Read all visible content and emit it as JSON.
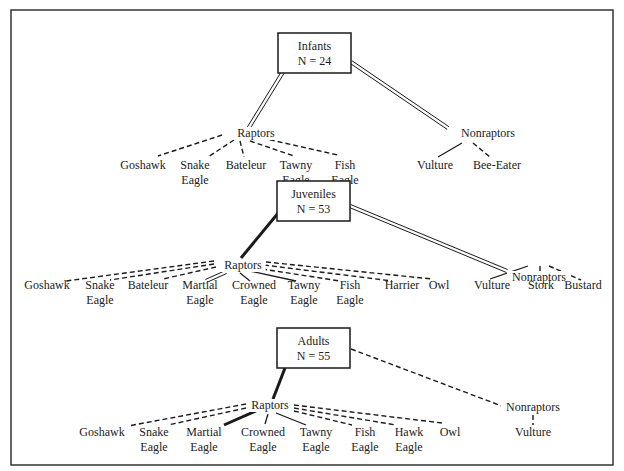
{
  "frame": {
    "x": 11,
    "y": 10,
    "w": 602,
    "h": 455,
    "stroke": "#333333"
  },
  "colors": {
    "line": "#1a1a1a",
    "text": "#222222"
  },
  "panels": [
    {
      "id": "infants",
      "box": {
        "label": "Infants",
        "n_label": "N = 24",
        "x": 278,
        "y": 33,
        "w": 73,
        "h": 40
      },
      "root_links": [
        {
          "target": "raptors",
          "style": "double",
          "from": [
            283,
            72
          ],
          "to": [
            248,
            129
          ]
        },
        {
          "target": "nonraptors",
          "style": "double",
          "from": [
            351,
            62
          ],
          "to": [
            448,
            128
          ]
        }
      ],
      "groups": [
        {
          "id": "raptors",
          "label": "Raptors",
          "x": 256,
          "y": 137
        },
        {
          "id": "nonraptors",
          "label": "Nonraptors",
          "x": 488,
          "y": 137
        }
      ],
      "leaves": [
        {
          "group": "raptors",
          "lines": [
            "Goshawk"
          ],
          "x": 143,
          "y": 169,
          "style": "dashed",
          "from": [
            222,
            135
          ],
          "to": [
            158,
            156
          ]
        },
        {
          "group": "raptors",
          "lines": [
            "Snake",
            "Eagle"
          ],
          "x": 195,
          "y": 169,
          "style": "dashed",
          "from": [
            234,
            140
          ],
          "to": [
            208,
            157
          ]
        },
        {
          "group": "raptors",
          "lines": [
            "Bateleur"
          ],
          "x": 246,
          "y": 169,
          "style": "dashed",
          "from": [
            240,
            141
          ],
          "to": [
            244,
            157
          ]
        },
        {
          "group": "raptors",
          "lines": [
            "Tawny",
            "Eagle"
          ],
          "x": 296,
          "y": 169,
          "style": "dashed",
          "from": [
            250,
            141
          ],
          "to": [
            294,
            156
          ]
        },
        {
          "group": "raptors",
          "lines": [
            "Fish",
            "Eagle"
          ],
          "x": 345,
          "y": 169,
          "style": "dashed",
          "from": [
            262,
            138
          ],
          "to": [
            338,
            155
          ]
        },
        {
          "group": "nonraptors",
          "lines": [
            "Vulture"
          ],
          "x": 435,
          "y": 169,
          "style": "solid",
          "from": [
            462,
            143
          ],
          "to": [
            438,
            157
          ]
        },
        {
          "group": "nonraptors",
          "lines": [
            "Bee-Eater"
          ],
          "x": 497,
          "y": 169,
          "style": "dashed",
          "from": [
            473,
            143
          ],
          "to": [
            490,
            157
          ]
        }
      ]
    },
    {
      "id": "juveniles",
      "box": {
        "label": "Juveniles",
        "n_label": "N = 53",
        "x": 277,
        "y": 181,
        "w": 73,
        "h": 40
      },
      "root_links": [
        {
          "target": "raptors",
          "style": "thick",
          "from": [
            279,
            212
          ],
          "to": [
            241,
            258
          ]
        },
        {
          "target": "nonraptors",
          "style": "double",
          "from": [
            350,
            206
          ],
          "to": [
            507,
            271
          ]
        }
      ],
      "groups": [
        {
          "id": "raptors",
          "label": "Raptors",
          "x": 243,
          "y": 269
        },
        {
          "id": "nonraptors",
          "label": "Nonraptors",
          "x": 539,
          "y": 281
        }
      ],
      "leaves": [
        {
          "group": "raptors",
          "lines": [
            "Goshawk"
          ],
          "x": 47,
          "y": 289,
          "style": "dashed",
          "from": [
            214,
            261
          ],
          "to": [
            66,
            281
          ]
        },
        {
          "group": "raptors",
          "lines": [
            "Snake",
            "Eagle"
          ],
          "x": 100,
          "y": 289,
          "style": "dashed",
          "from": [
            214,
            264
          ],
          "to": [
            110,
            280
          ]
        },
        {
          "group": "raptors",
          "lines": [
            "Bateleur"
          ],
          "x": 148,
          "y": 289,
          "style": "dashed",
          "from": [
            216,
            267
          ],
          "to": [
            163,
            279
          ]
        },
        {
          "group": "raptors",
          "lines": [
            "Martial",
            "Eagle"
          ],
          "x": 200,
          "y": 289,
          "style": "double",
          "from": [
            226,
            272
          ],
          "to": [
            206,
            281
          ]
        },
        {
          "group": "raptors",
          "lines": [
            "Crowned",
            "Eagle"
          ],
          "x": 254,
          "y": 289,
          "style": "solid",
          "from": [
            240,
            273
          ],
          "to": [
            250,
            281
          ]
        },
        {
          "group": "raptors",
          "lines": [
            "Tawny",
            "Eagle"
          ],
          "x": 304,
          "y": 289,
          "style": "solid",
          "from": [
            250,
            271
          ],
          "to": [
            296,
            281
          ]
        },
        {
          "group": "raptors",
          "lines": [
            "Fish",
            "Eagle"
          ],
          "x": 350,
          "y": 289,
          "style": "dashed",
          "from": [
            262,
            269
          ],
          "to": [
            340,
            281
          ]
        },
        {
          "group": "raptors",
          "lines": [
            "Harrier"
          ],
          "x": 402,
          "y": 289,
          "style": "dashed",
          "from": [
            264,
            265
          ],
          "to": [
            392,
            281
          ]
        },
        {
          "group": "raptors",
          "lines": [
            "Owl"
          ],
          "x": 439,
          "y": 289,
          "style": "dashed",
          "from": [
            266,
            262
          ],
          "to": [
            432,
            279
          ]
        },
        {
          "group": "nonraptors",
          "lines": [
            "Vulture"
          ],
          "x": 492,
          "y": 289,
          "style": "solid",
          "from": [
            528,
            266
          ],
          "to": [
            490,
            279
          ]
        },
        {
          "group": "nonraptors",
          "lines": [
            "Stork"
          ],
          "x": 541,
          "y": 289,
          "style": "dashed",
          "from": [
            540,
            266
          ],
          "to": [
            540,
            280
          ]
        },
        {
          "group": "nonraptors",
          "lines": [
            "Bustard"
          ],
          "x": 583,
          "y": 289,
          "style": "dashed",
          "from": [
            549,
            266
          ],
          "to": [
            581,
            280
          ]
        }
      ]
    },
    {
      "id": "adults",
      "box": {
        "label": "Adults",
        "n_label": "N = 55",
        "x": 277,
        "y": 328,
        "w": 73,
        "h": 40
      },
      "root_links": [
        {
          "target": "raptors",
          "style": "thick",
          "from": [
            285,
            368
          ],
          "to": [
            273,
            399
          ]
        },
        {
          "target": "nonraptors",
          "style": "dashed",
          "from": [
            351,
            349
          ],
          "to": [
            507,
            408
          ]
        }
      ],
      "groups": [
        {
          "id": "raptors",
          "label": "Raptors",
          "x": 270,
          "y": 409
        },
        {
          "id": "nonraptors",
          "label": "Nonraptors",
          "x": 533,
          "y": 411
        }
      ],
      "leaves": [
        {
          "group": "raptors",
          "lines": [
            "Goshawk"
          ],
          "x": 102,
          "y": 436,
          "style": "dashed",
          "from": [
            246,
            404
          ],
          "to": [
            128,
            426
          ]
        },
        {
          "group": "raptors",
          "lines": [
            "Snake",
            "Eagle"
          ],
          "x": 154,
          "y": 436,
          "style": "dashed",
          "from": [
            246,
            408
          ],
          "to": [
            168,
            425
          ]
        },
        {
          "group": "raptors",
          "lines": [
            "Martial",
            "Eagle"
          ],
          "x": 204,
          "y": 436,
          "style": "thick",
          "from": [
            258,
            410
          ],
          "to": [
            224,
            425
          ]
        },
        {
          "group": "raptors",
          "lines": [
            "Crowned",
            "Eagle"
          ],
          "x": 263,
          "y": 436,
          "style": "solid",
          "from": [
            268,
            414
          ],
          "to": [
            265,
            424
          ]
        },
        {
          "group": "raptors",
          "lines": [
            "Tawny",
            "Eagle"
          ],
          "x": 316,
          "y": 436,
          "style": "solid",
          "from": [
            276,
            413
          ],
          "to": [
            306,
            425
          ]
        },
        {
          "group": "raptors",
          "lines": [
            "Fish",
            "Eagle"
          ],
          "x": 365,
          "y": 436,
          "style": "dashed",
          "from": [
            294,
            411
          ],
          "to": [
            352,
            425
          ]
        },
        {
          "group": "raptors",
          "lines": [
            "Hawk",
            "Eagle"
          ],
          "x": 409,
          "y": 436,
          "style": "dashed",
          "from": [
            294,
            408
          ],
          "to": [
            396,
            425
          ]
        },
        {
          "group": "raptors",
          "lines": [
            "Owl"
          ],
          "x": 450,
          "y": 436,
          "style": "dashed",
          "from": [
            294,
            405
          ],
          "to": [
            442,
            423
          ]
        },
        {
          "group": "nonraptors",
          "lines": [
            "Vulture"
          ],
          "x": 533,
          "y": 436,
          "style": "dashed",
          "from": [
            533,
            415
          ],
          "to": [
            533,
            425
          ]
        }
      ]
    }
  ]
}
